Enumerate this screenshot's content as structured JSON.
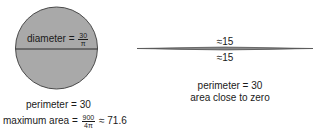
{
  "circle": {
    "fill": "#a9a9a9",
    "stroke": "#4a4a4a",
    "diameter_label": "diameter =",
    "diameter_fraction": {
      "numerator": "30",
      "denominator": "π"
    },
    "perimeter_label": "perimeter = 30",
    "max_area_label": "maximum area =",
    "max_area_fraction": {
      "numerator": "900",
      "denominator": "4π"
    },
    "max_area_value": "≈ 71.6"
  },
  "lens": {
    "fill": "#8a8a8a",
    "top_label": "≈15",
    "bottom_label": "≈15",
    "perimeter_label": "perimeter = 30",
    "area_label": "area close to zero"
  }
}
